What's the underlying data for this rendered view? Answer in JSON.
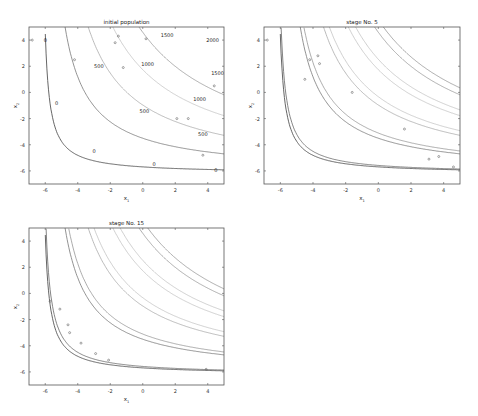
{
  "chart_data": [
    {
      "type": "line",
      "title": "initial population",
      "xlabel": "x1",
      "ylabel": "x2",
      "xlim": [
        -7,
        5
      ],
      "ylim": [
        -7,
        5
      ],
      "xticks": [
        -6,
        -4,
        -2,
        0,
        2,
        4
      ],
      "yticks": [
        -6,
        -4,
        -2,
        0,
        2,
        4
      ],
      "grid": false,
      "contour_levels": [
        0,
        500,
        1000,
        1500,
        2000
      ],
      "contour_labels": [
        {
          "text": "0",
          "x": -6.0,
          "y": 4.0
        },
        {
          "text": "0",
          "x": -5.3,
          "y": -0.8
        },
        {
          "text": "0",
          "x": -3.0,
          "y": -4.5
        },
        {
          "text": "0",
          "x": 0.7,
          "y": -5.5
        },
        {
          "text": "0",
          "x": 4.5,
          "y": -5.9
        },
        {
          "text": "500",
          "x": -2.7,
          "y": 2.0
        },
        {
          "text": "500",
          "x": 0.1,
          "y": -1.4
        },
        {
          "text": "500",
          "x": 3.7,
          "y": -3.2
        },
        {
          "text": "1000",
          "x": 0.3,
          "y": 2.2
        },
        {
          "text": "1000",
          "x": 3.5,
          "y": -0.5
        },
        {
          "text": "1500",
          "x": 1.5,
          "y": 4.4
        },
        {
          "text": "1500",
          "x": 4.6,
          "y": 1.5
        },
        {
          "text": "2000",
          "x": 4.3,
          "y": 4.0
        }
      ],
      "points": [
        {
          "x": -6.8,
          "y": 4.0
        },
        {
          "x": -4.2,
          "y": 2.5
        },
        {
          "x": -1.7,
          "y": 3.8
        },
        {
          "x": -1.5,
          "y": 4.3
        },
        {
          "x": -1.2,
          "y": 1.9
        },
        {
          "x": 0.2,
          "y": 4.1
        },
        {
          "x": 2.1,
          "y": -2.0
        },
        {
          "x": 2.8,
          "y": -2.0
        },
        {
          "x": 3.7,
          "y": -4.8
        },
        {
          "x": 4.4,
          "y": 0.5
        }
      ]
    },
    {
      "type": "line",
      "title": "stage No. 5",
      "xlabel": "x1",
      "ylabel": "x2",
      "xlim": [
        -7,
        5
      ],
      "ylim": [
        -7,
        5
      ],
      "xticks": [
        -6,
        -4,
        -2,
        0,
        2,
        4
      ],
      "yticks": [
        -6,
        -4,
        -2,
        0,
        2,
        4
      ],
      "grid": false,
      "points": [
        {
          "x": -6.8,
          "y": 4.0
        },
        {
          "x": -4.2,
          "y": 2.5
        },
        {
          "x": -3.7,
          "y": 2.8
        },
        {
          "x": -3.6,
          "y": 2.2
        },
        {
          "x": -4.5,
          "y": 1.0
        },
        {
          "x": -1.6,
          "y": 0.0
        },
        {
          "x": 1.6,
          "y": -2.8
        },
        {
          "x": 3.1,
          "y": -5.1
        },
        {
          "x": 3.7,
          "y": -4.9
        },
        {
          "x": 4.6,
          "y": -5.7
        }
      ]
    },
    {
      "type": "line",
      "title": "stage No. 15",
      "xlabel": "x1",
      "ylabel": "x2",
      "xlim": [
        -7,
        5
      ],
      "ylim": [
        -7,
        5
      ],
      "xticks": [
        -6,
        -4,
        -2,
        0,
        2,
        4
      ],
      "yticks": [
        -6,
        -4,
        -2,
        0,
        2,
        4
      ],
      "grid": false,
      "points": [
        {
          "x": -5.7,
          "y": -0.6
        },
        {
          "x": -5.1,
          "y": -1.2
        },
        {
          "x": -4.6,
          "y": -2.4
        },
        {
          "x": -4.5,
          "y": -3.0
        },
        {
          "x": -3.8,
          "y": -3.8
        },
        {
          "x": -2.9,
          "y": -4.6
        },
        {
          "x": -2.1,
          "y": -5.1
        },
        {
          "x": 3.9,
          "y": -5.8
        }
      ]
    }
  ]
}
